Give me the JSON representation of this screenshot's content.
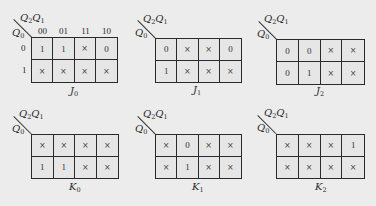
{
  "figure": {
    "row_variable": {
      "base": "Q",
      "sub": "0"
    },
    "col_variables": [
      {
        "base": "Q",
        "sub": "2"
      },
      {
        "base": "Q",
        "sub": "1"
      }
    ],
    "col_headers": [
      "00",
      "01",
      "11",
      "10"
    ],
    "row_headers": [
      "0",
      "1"
    ]
  },
  "maps": [
    {
      "id": "J0",
      "label": {
        "base": "J",
        "sub": "0"
      },
      "show_headers": true,
      "cells": [
        [
          "1",
          "1",
          "×",
          "0"
        ],
        [
          "×",
          "×",
          "×",
          "×"
        ]
      ]
    },
    {
      "id": "J1",
      "label": {
        "base": "J",
        "sub": "1"
      },
      "show_headers": false,
      "cells": [
        [
          "0",
          "×",
          "×",
          "0"
        ],
        [
          "1",
          "×",
          "×",
          "×"
        ]
      ]
    },
    {
      "id": "J2",
      "label": {
        "base": "J",
        "sub": "2"
      },
      "show_headers": false,
      "cells": [
        [
          "0",
          "0",
          "×",
          "×"
        ],
        [
          "0",
          "1",
          "×",
          "×"
        ]
      ]
    },
    {
      "id": "K0",
      "label": {
        "base": "K",
        "sub": "0"
      },
      "show_headers": false,
      "cells": [
        [
          "×",
          "×",
          "×",
          "×"
        ],
        [
          "1",
          "1",
          "×",
          "×"
        ]
      ]
    },
    {
      "id": "K1",
      "label": {
        "base": "K",
        "sub": "1"
      },
      "show_headers": false,
      "cells": [
        [
          "×",
          "0",
          "×",
          "×"
        ],
        [
          "×",
          "1",
          "×",
          "×"
        ]
      ]
    },
    {
      "id": "K2",
      "label": {
        "base": "K",
        "sub": "2"
      },
      "show_headers": false,
      "cells": [
        [
          "×",
          "×",
          "×",
          "1"
        ],
        [
          "×",
          "×",
          "×",
          "×"
        ]
      ]
    }
  ]
}
